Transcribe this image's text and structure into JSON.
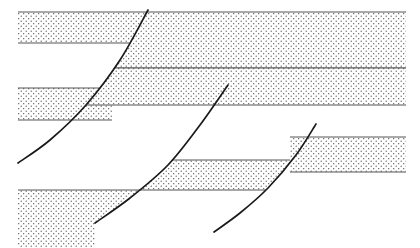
{
  "figure": {
    "type": "geologic-cross-section",
    "width": 420,
    "height": 248,
    "background_color": "#ffffff",
    "line_color": "#1a1a1a",
    "stipple_color": "#4d4d4d",
    "stipple_background": "#ffffff",
    "bed_edge_color": "#555555"
  },
  "diagram_data": {
    "type": "cross-section",
    "description": "Four stippled sedimentary beds cut and offset by three concave-up (listric) normal faults dipping to the left. Each fault drops the hanging wall on its left side downward, producing a stair-step offset of the beds from right to left.",
    "drawing_extent": {
      "x_min": 18,
      "x_max": 406,
      "y_min": 10,
      "y_max": 248
    },
    "stipple_pattern": {
      "name": "dot-stipple",
      "dot_radius": 0.6,
      "spacing_x": 5,
      "spacing_y": 5,
      "stagger": true
    },
    "beds": [
      {
        "id": "bed-1",
        "label": "Bed 1 (uppermost)",
        "filled": true,
        "segments": [
          {
            "id": "bed-1-block-a",
            "block": "block-a",
            "x_left": 18,
            "x_right": 150,
            "y_top": 12,
            "y_bottom": 43
          },
          {
            "id": "bed-1-block-b",
            "block": "block-b",
            "x_left": 150,
            "x_right": 406,
            "y_top": 12,
            "y_bottom": 68
          }
        ]
      },
      {
        "id": "bed-2",
        "label": "Bed 2",
        "filled": true,
        "segments": [
          {
            "id": "bed-2-block-a",
            "block": "block-a",
            "x_left": 18,
            "x_right": 112,
            "y_top": 88,
            "y_bottom": 120
          },
          {
            "id": "bed-2-block-b",
            "block": "block-b",
            "x_left": 112,
            "x_right": 228,
            "y_top": 68,
            "y_bottom": 105
          },
          {
            "id": "bed-2-block-c",
            "block": "block-c",
            "x_left": 228,
            "x_right": 406,
            "y_top": 68,
            "y_bottom": 105
          }
        ]
      },
      {
        "id": "bed-3",
        "label": "Bed 3",
        "filled": true,
        "segments": [
          {
            "id": "bed-3-block-b",
            "block": "block-b",
            "x_left": 138,
            "x_right": 290,
            "y_top": 160,
            "y_bottom": 190
          },
          {
            "id": "bed-3-block-c",
            "block": "block-c",
            "x_left": 290,
            "x_right": 406,
            "y_top": 137,
            "y_bottom": 172
          }
        ]
      },
      {
        "id": "bed-4",
        "label": "Bed 4 (lowermost)",
        "filled": true,
        "segments": [
          {
            "id": "bed-4-block-a",
            "block": "block-a",
            "x_left": 18,
            "x_right": 140,
            "y_top": 190,
            "y_bottom": 248
          }
        ]
      }
    ],
    "faults": [
      {
        "id": "fault-1",
        "label": "Fault 1 (left)",
        "sense": "normal",
        "dip_direction": "left",
        "geometry": "listric",
        "path": [
          {
            "x": 148,
            "y": 10
          },
          {
            "x": 120,
            "y": 60
          },
          {
            "x": 86,
            "y": 105
          },
          {
            "x": 50,
            "y": 140
          },
          {
            "x": 18,
            "y": 163
          }
        ]
      },
      {
        "id": "fault-2",
        "label": "Fault 2 (center)",
        "sense": "normal",
        "dip_direction": "left",
        "geometry": "listric",
        "path": [
          {
            "x": 228,
            "y": 85
          },
          {
            "x": 200,
            "y": 125
          },
          {
            "x": 168,
            "y": 165
          },
          {
            "x": 130,
            "y": 198
          },
          {
            "x": 95,
            "y": 223
          }
        ]
      },
      {
        "id": "fault-3",
        "label": "Fault 3 (right)",
        "sense": "normal",
        "dip_direction": "left",
        "geometry": "listric",
        "path": [
          {
            "x": 316,
            "y": 124
          },
          {
            "x": 296,
            "y": 155
          },
          {
            "x": 268,
            "y": 188
          },
          {
            "x": 240,
            "y": 213
          },
          {
            "x": 214,
            "y": 232
          }
        ]
      }
    ],
    "fault_blocks": [
      {
        "id": "block-a",
        "label": "Westernmost (most downthrown) block"
      },
      {
        "id": "block-b",
        "label": "Central block"
      },
      {
        "id": "block-c",
        "label": "Easternmost (least displaced) block"
      }
    ]
  }
}
